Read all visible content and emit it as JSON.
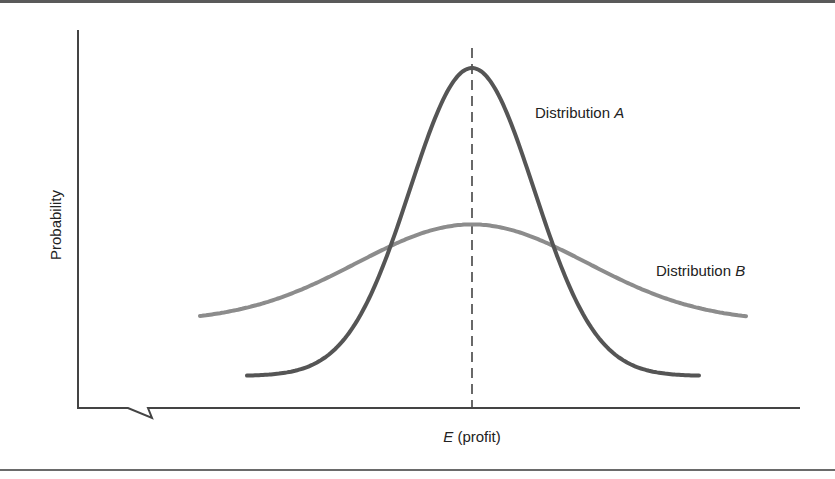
{
  "chart_data": {
    "type": "line",
    "title": "",
    "xlabel_var": "E",
    "xlabel_rest": " (profit)",
    "xlabel": "E (profit)",
    "ylabel": "Probability",
    "grid": false,
    "legend_position": "inline annotations",
    "axis_break": "x-axis break symbol near origin",
    "mean_marker": "dashed vertical line at expected profit (peak of both distributions)",
    "series": [
      {
        "name": "Distribution A",
        "name_prefix": "Distribution ",
        "name_var": "A",
        "shape": "normal, narrow (small variance)",
        "color": "#555555",
        "relative_peak_height": 1.0,
        "x_range_px": [
          247,
          700
        ],
        "peak_x_px": 472
      },
      {
        "name": "Distribution B",
        "name_prefix": "Distribution ",
        "name_var": "B",
        "shape": "normal, wide (large variance)",
        "color": "#8c8c8c",
        "relative_peak_height": 0.54,
        "x_range_px": [
          200,
          747
        ],
        "peak_x_px": 472
      }
    ]
  },
  "colors": {
    "axis": "#444444",
    "curve_a": "#555555",
    "curve_b": "#8c8c8c",
    "dashed_line": "#444444",
    "text": "#222222"
  }
}
